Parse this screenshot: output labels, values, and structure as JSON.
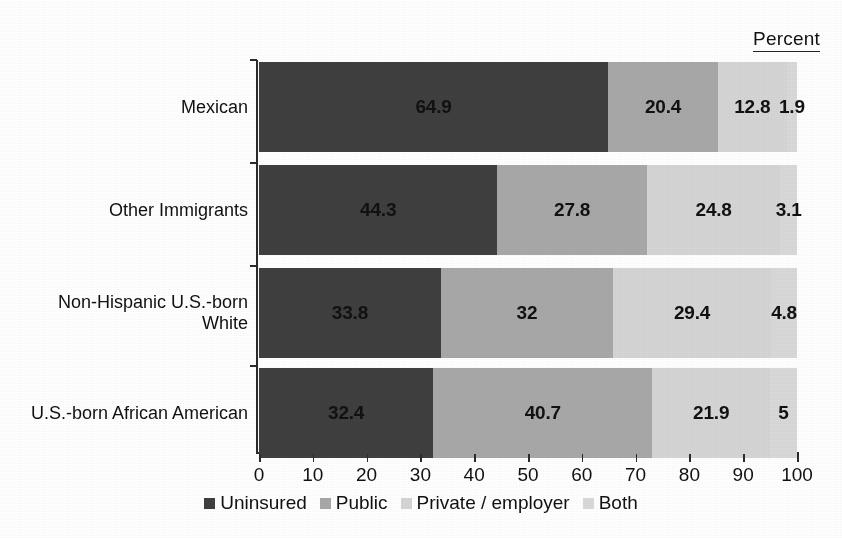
{
  "header": {
    "percent_label": "Percent"
  },
  "chart_data": {
    "type": "bar",
    "orientation": "horizontal",
    "stacked": true,
    "normalized": true,
    "title": "",
    "subtitle": "",
    "xlabel": "",
    "ylabel": "",
    "corner_label": "Percent",
    "categories": [
      "Mexican",
      "Other Immigrants",
      "Non-Hispanic U.S.-born\nWhite",
      "U.S.-born African American"
    ],
    "series": [
      {
        "name": "Uninsured",
        "color": "#3f3f3f",
        "values": [
          64.9,
          44.3,
          33.8,
          32.4
        ]
      },
      {
        "name": "Public",
        "color": "#a8a8a8",
        "values": [
          20.4,
          27.8,
          32.0,
          40.7
        ]
      },
      {
        "name": "Private / employer",
        "color": "#d5d5d5",
        "values": [
          12.8,
          24.8,
          29.4,
          21.9
        ]
      },
      {
        "name": "Both",
        "color": "#d9d9d9",
        "values": [
          1.9,
          3.1,
          4.8,
          5.0
        ]
      }
    ],
    "data_labels": [
      [
        "64.9",
        "20.4",
        "12.8",
        "1.9"
      ],
      [
        "44.3",
        "27.8",
        "24.8",
        "3.1"
      ],
      [
        "33.8",
        "32",
        "29.4",
        "4.8"
      ],
      [
        "32.4",
        "40.7",
        "21.9",
        "5"
      ]
    ],
    "xlim": [
      0,
      100
    ],
    "xticks": [
      0,
      10,
      20,
      30,
      40,
      50,
      60,
      70,
      80,
      90,
      100
    ],
    "xtick_labels": [
      "0",
      "10",
      "20",
      "30",
      "40",
      "50",
      "60",
      "70",
      "80",
      "90",
      "100"
    ],
    "grid": false,
    "legend_position": "bottom",
    "legend": [
      "Uninsured",
      "Public",
      "Private / employer",
      "Both"
    ]
  },
  "colors": {
    "uninsured": "#3f3f3f",
    "public": "#a8a8a8",
    "private_employer": "#d5d5d5",
    "both": "#d9d9d9",
    "axis": "#2b2b2b",
    "text": "#111111",
    "background": "#ffffff"
  }
}
